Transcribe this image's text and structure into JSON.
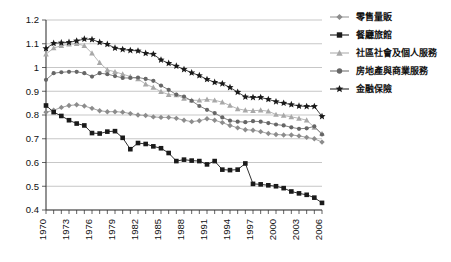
{
  "chart_data": {
    "type": "line",
    "title": "",
    "xlabel": "",
    "ylabel": "",
    "xlim": [
      1970,
      2006
    ],
    "ylim": [
      0.4,
      1.2
    ],
    "grid": true,
    "legend_position": "right",
    "x": [
      1970,
      1971,
      1972,
      1973,
      1974,
      1975,
      1976,
      1977,
      1978,
      1979,
      1980,
      1981,
      1982,
      1983,
      1984,
      1985,
      1986,
      1987,
      1988,
      1989,
      1990,
      1991,
      1992,
      1993,
      1994,
      1995,
      1996,
      1997,
      1998,
      1999,
      2000,
      2001,
      2002,
      2003,
      2004,
      2005,
      2006
    ],
    "xtick_labels": [
      "1970",
      "1973",
      "1976",
      "1979",
      "1982",
      "1985",
      "1988",
      "1991",
      "1994",
      "1997",
      "2000",
      "2003",
      "2006"
    ],
    "ytick_labels": [
      "0.4",
      "0.5",
      "0.6",
      "0.7",
      "0.8",
      "0.9",
      "1",
      "1.1",
      "1.2"
    ],
    "ytick_values": [
      0.4,
      0.5,
      0.6,
      0.7,
      0.8,
      0.9,
      1.0,
      1.1,
      1.2
    ],
    "series": [
      {
        "name": "零售量販",
        "marker": "diamond",
        "color": "#8c8c8c",
        "line_color": "#9a9a9a",
        "values": [
          0.812,
          0.82,
          0.832,
          0.84,
          0.843,
          0.838,
          0.828,
          0.818,
          0.814,
          0.814,
          0.812,
          0.806,
          0.8,
          0.798,
          0.792,
          0.79,
          0.79,
          0.786,
          0.778,
          0.772,
          0.776,
          0.784,
          0.778,
          0.768,
          0.756,
          0.746,
          0.738,
          0.736,
          0.73,
          0.722,
          0.718,
          0.716,
          0.716,
          0.712,
          0.706,
          0.7,
          0.686
        ]
      },
      {
        "name": "餐廳旅館",
        "marker": "square",
        "color": "#1a1a1a",
        "line_color": "#1a1a1a",
        "values": [
          0.84,
          0.812,
          0.796,
          0.778,
          0.764,
          0.756,
          0.724,
          0.722,
          0.73,
          0.732,
          0.704,
          0.656,
          0.682,
          0.678,
          0.668,
          0.66,
          0.64,
          0.606,
          0.612,
          0.608,
          0.606,
          0.592,
          0.606,
          0.57,
          0.568,
          0.57,
          0.596,
          0.51,
          0.508,
          0.504,
          0.5,
          0.492,
          0.478,
          0.47,
          0.464,
          0.452,
          0.43
        ]
      },
      {
        "name": "社區社會及個人服務",
        "marker": "triangle",
        "color": "#a8a8a8",
        "line_color": "#b0b0b0",
        "values": [
          1.056,
          1.082,
          1.092,
          1.098,
          1.1,
          1.092,
          1.06,
          1.02,
          0.99,
          0.982,
          0.972,
          0.962,
          0.952,
          0.93,
          0.916,
          0.898,
          0.886,
          0.884,
          0.87,
          0.862,
          0.862,
          0.866,
          0.862,
          0.854,
          0.84,
          0.826,
          0.82,
          0.818,
          0.82,
          0.816,
          0.802,
          0.798,
          0.792,
          0.786,
          0.778,
          0.748,
          0.722
        ]
      },
      {
        "name": "房地產與商業服務",
        "marker": "circle",
        "color": "#666666",
        "line_color": "#737373",
        "values": [
          0.948,
          0.976,
          0.98,
          0.982,
          0.982,
          0.976,
          0.962,
          0.976,
          0.972,
          0.964,
          0.956,
          0.956,
          0.958,
          0.952,
          0.944,
          0.924,
          0.906,
          0.886,
          0.878,
          0.86,
          0.838,
          0.822,
          0.808,
          0.79,
          0.776,
          0.772,
          0.77,
          0.774,
          0.772,
          0.766,
          0.76,
          0.756,
          0.748,
          0.742,
          0.744,
          0.752,
          0.718
        ]
      },
      {
        "name": "金融保險",
        "marker": "star",
        "color": "#1a1a1a",
        "line_color": "#2b2b2b",
        "values": [
          1.08,
          1.102,
          1.104,
          1.106,
          1.112,
          1.12,
          1.118,
          1.106,
          1.098,
          1.082,
          1.076,
          1.072,
          1.07,
          1.06,
          1.056,
          1.032,
          1.018,
          1.006,
          0.992,
          0.978,
          0.966,
          0.95,
          0.938,
          0.932,
          0.916,
          0.896,
          0.876,
          0.874,
          0.874,
          0.866,
          0.856,
          0.85,
          0.844,
          0.838,
          0.836,
          0.836,
          0.794
        ]
      }
    ]
  },
  "legend": {
    "items": [
      {
        "label": "零售量販"
      },
      {
        "label": "餐廳旅館"
      },
      {
        "label": "社區社會及個人服務"
      },
      {
        "label": "房地產與商業服務"
      },
      {
        "label": "金融保險"
      }
    ]
  }
}
